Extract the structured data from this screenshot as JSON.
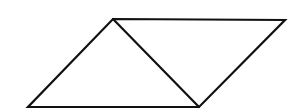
{
  "diagram": {
    "type": "parallelogram-with-diagonal",
    "canvas": {
      "width": 296,
      "height": 112
    },
    "stroke_color": "#111111",
    "stroke_width": 2.2,
    "background": "#ffffff",
    "vertices": {
      "top_left": [
        113,
        19
      ],
      "top_right": [
        285,
        20
      ],
      "bottom_right": [
        199,
        107
      ],
      "bottom_left": [
        28,
        107
      ]
    },
    "diagonal": {
      "from": "top_left",
      "to": "bottom_right"
    },
    "triangles": [
      {
        "name": "left-triangle",
        "points": [
          "top_left",
          "bottom_right",
          "bottom_left"
        ]
      },
      {
        "name": "right-triangle",
        "points": [
          "top_left",
          "top_right",
          "bottom_right"
        ]
      }
    ]
  }
}
